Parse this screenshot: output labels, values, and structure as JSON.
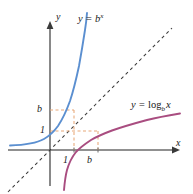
{
  "figure": {
    "background_color": "#ffffff",
    "width": 193,
    "height": 194
  },
  "axes": {
    "x_label": "x",
    "y_label": "y",
    "origin_px": [
      50,
      150
    ],
    "axis_color": "#6b6b6b",
    "x_axis_start_px": [
      8,
      150
    ],
    "x_axis_end_px": [
      180,
      150
    ],
    "y_axis_start_px": [
      50,
      186
    ],
    "y_axis_end_px": [
      50,
      22
    ]
  },
  "ticks": {
    "y_b": "b",
    "y_1": "1",
    "x_1": "1",
    "x_b": "b"
  },
  "curves": [
    {
      "name": "exponential",
      "label_text": "y = b",
      "label_exponent": "x",
      "color": "#5b8fd0",
      "stroke_width": 1.8,
      "description": "y = b^x, increasing exponential passing through (0,1) and (1,b)"
    },
    {
      "name": "logarithmic",
      "label_prefix": "y = ",
      "label_fn": "log",
      "label_base": "b",
      "label_arg": "x",
      "color": "#a94d80",
      "stroke_width": 1.8,
      "description": "y = log_b x, increasing logarithm passing through (1,0) and (b,1)"
    },
    {
      "name": "identity-line",
      "color": "#3a3a3a",
      "stroke_width": 1.0,
      "dash": "3 3",
      "description": "dashed line y = x, axis of reflection"
    }
  ],
  "guides": {
    "color": "#e8a878",
    "dash": "3 2.5",
    "stroke_width": 1.0,
    "points": [
      {
        "name": "point-1-b",
        "x_value": "1",
        "y_value": "b"
      },
      {
        "name": "point-b-1",
        "x_value": "b",
        "y_value": "1"
      }
    ]
  }
}
